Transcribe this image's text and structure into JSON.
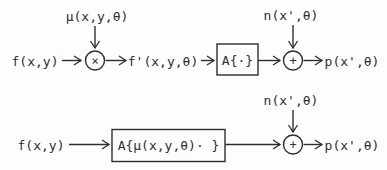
{
  "diagram": {
    "colors": {
      "ink": "#2e2e2e",
      "background": "#fdfdfd"
    },
    "top_row": {
      "input_label": "f(x,y)",
      "multiplier_top_label": "μ(x,y,θ)",
      "multiplier_symbol": "×",
      "intermediate_label": "f'(x,y,θ)",
      "operator_box_label": "A{·}",
      "noise_label": "n(x',θ)",
      "adder_symbol": "+",
      "output_label": "p(x',θ)"
    },
    "bottom_row": {
      "input_label": "f(x,y)",
      "operator_box_label": "A{μ(x,y,θ)· }",
      "noise_label": "n(x',θ)",
      "adder_symbol": "+",
      "output_label": "p(x',θ)"
    }
  }
}
